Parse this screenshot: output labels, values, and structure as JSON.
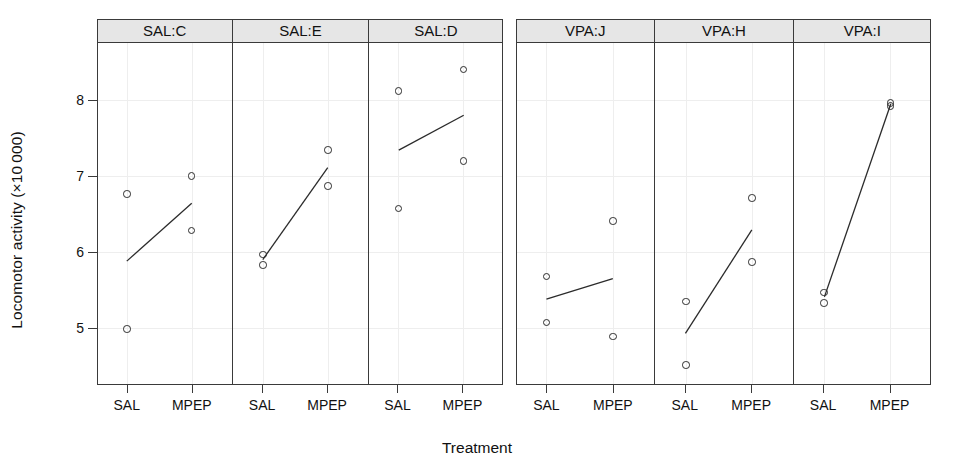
{
  "chart_data": {
    "type": "scatter",
    "title": "",
    "xlabel": "Treatment",
    "ylabel": "Locomotor activity (×10 000)",
    "ylim": [
      4.25,
      8.75
    ],
    "yticks": [
      5,
      6,
      7,
      8
    ],
    "ytick_labels": [
      "5",
      "6",
      "7",
      "8"
    ],
    "categories": [
      "SAL",
      "MPEP"
    ],
    "grid": true,
    "legend": "none",
    "panel_strip_color": "#e6e6e6",
    "point_color": "#2b2b2b",
    "line_color": "#2b2b2b",
    "groups": [
      {
        "name": "SAL",
        "panels": [
          {
            "label": "SAL:C",
            "points": [
              {
                "x": "SAL",
                "y": 6.76
              },
              {
                "x": "SAL",
                "y": 4.99
              },
              {
                "x": "MPEP",
                "y": 7.0
              },
              {
                "x": "MPEP",
                "y": 6.28
              }
            ],
            "fit_line": {
              "x1": "SAL",
              "y1": 5.88,
              "x2": "MPEP",
              "y2": 6.64
            }
          },
          {
            "label": "SAL:E",
            "points": [
              {
                "x": "SAL",
                "y": 5.97
              },
              {
                "x": "SAL",
                "y": 5.83
              },
              {
                "x": "MPEP",
                "y": 7.34
              },
              {
                "x": "MPEP",
                "y": 6.87
              }
            ],
            "fit_line": {
              "x1": "SAL",
              "y1": 5.9,
              "x2": "MPEP",
              "y2": 7.11
            }
          },
          {
            "label": "SAL:D",
            "points": [
              {
                "x": "SAL",
                "y": 8.12
              },
              {
                "x": "SAL",
                "y": 6.57
              },
              {
                "x": "MPEP",
                "y": 8.4
              },
              {
                "x": "MPEP",
                "y": 7.2
              }
            ],
            "fit_line": {
              "x1": "SAL",
              "y1": 7.34,
              "x2": "MPEP",
              "y2": 7.8
            }
          }
        ]
      },
      {
        "name": "VPA",
        "panels": [
          {
            "label": "VPA:J",
            "points": [
              {
                "x": "SAL",
                "y": 5.68
              },
              {
                "x": "SAL",
                "y": 5.07
              },
              {
                "x": "MPEP",
                "y": 6.41
              },
              {
                "x": "MPEP",
                "y": 4.89
              }
            ],
            "fit_line": {
              "x1": "SAL",
              "y1": 5.38,
              "x2": "MPEP",
              "y2": 5.65
            }
          },
          {
            "label": "VPA:H",
            "points": [
              {
                "x": "SAL",
                "y": 5.35
              },
              {
                "x": "SAL",
                "y": 4.51
              },
              {
                "x": "MPEP",
                "y": 6.71
              },
              {
                "x": "MPEP",
                "y": 5.87
              }
            ],
            "fit_line": {
              "x1": "SAL",
              "y1": 4.93,
              "x2": "MPEP",
              "y2": 6.29
            }
          },
          {
            "label": "VPA:I",
            "points": [
              {
                "x": "SAL",
                "y": 5.47
              },
              {
                "x": "SAL",
                "y": 5.33
              },
              {
                "x": "MPEP",
                "y": 7.96
              },
              {
                "x": "MPEP",
                "y": 7.92
              }
            ],
            "fit_line": {
              "x1": "SAL",
              "y1": 5.41,
              "x2": "MPEP",
              "y2": 7.95
            }
          }
        ]
      }
    ]
  }
}
